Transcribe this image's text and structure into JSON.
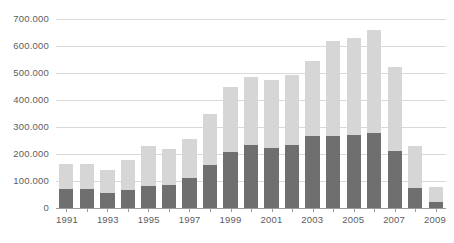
{
  "chart_data": {
    "type": "bar",
    "stacked": true,
    "title": "",
    "subtitle": "",
    "xlabel": "",
    "ylabel": "",
    "ylim": [
      0,
      700000
    ],
    "ytick_values": [
      0,
      100000,
      200000,
      300000,
      400000,
      500000,
      600000,
      700000
    ],
    "ytick_labels": [
      "0",
      "100.000",
      "200.000",
      "300.000",
      "400.000",
      "500.000",
      "600.000",
      "700.000"
    ],
    "grid": true,
    "legend": "none",
    "categories": [
      "1991",
      "1992",
      "1993",
      "1994",
      "1995",
      "1996",
      "1997",
      "1998",
      "1999",
      "2000",
      "2001",
      "2002",
      "2003",
      "2004",
      "2005",
      "2006",
      "2007",
      "2008",
      "2009"
    ],
    "xtick_labels_shown": [
      "1991",
      "",
      "1993",
      "",
      "1995",
      "",
      "1997",
      "",
      "1999",
      "",
      "2001",
      "",
      "2003",
      "",
      "2005",
      "",
      "2007",
      "",
      "2009"
    ],
    "series": [
      {
        "name": "lower-segment",
        "color": "#6f6f6f",
        "values": [
          70000,
          70000,
          55000,
          68000,
          82000,
          86000,
          110000,
          160000,
          208000,
          233000,
          224000,
          234000,
          266000,
          266000,
          270000,
          278000,
          213000,
          75000,
          22000
        ]
      },
      {
        "name": "upper-segment",
        "color": "#d6d6d6",
        "values": [
          92000,
          92000,
          86000,
          111000,
          148000,
          133000,
          145000,
          188000,
          242000,
          252000,
          249000,
          260000,
          278000,
          351000,
          359000,
          381000,
          310000,
          155000,
          56000
        ]
      }
    ],
    "totals": [
      162000,
      162000,
      141000,
      179000,
      230000,
      219000,
      255000,
      348000,
      450000,
      485000,
      473000,
      494000,
      544000,
      617000,
      629000,
      659000,
      523000,
      230000,
      78000
    ],
    "colors": {
      "lower": "#6f6f6f",
      "upper": "#d6d6d6",
      "gridline": "#d9d9d9",
      "axis": "#9b9b9b",
      "tick_text": "#5d5d5d",
      "background": "#ffffff"
    }
  }
}
